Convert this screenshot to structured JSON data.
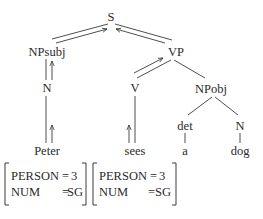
{
  "tree": {
    "nodes": {
      "s": "S",
      "np_subj": "NPsubj",
      "vp": "VP",
      "n_subj": "N",
      "v": "V",
      "np_obj": "NPobj",
      "det": "det",
      "n_obj": "N"
    },
    "leaves": {
      "peter": "Peter",
      "sees": "sees",
      "a": "a",
      "dog": "dog"
    },
    "feature_structures": [
      {
        "for": "Peter",
        "rows": [
          {
            "feature": "PERSON",
            "eq": "=",
            "value": "3"
          },
          {
            "feature": "NUM",
            "eq": "=",
            "value": "SG"
          }
        ]
      },
      {
        "for": "sees",
        "rows": [
          {
            "feature": "PERSON",
            "eq": "=",
            "value": "3"
          },
          {
            "feature": "NUM",
            "eq": "=",
            "value": "SG"
          }
        ]
      }
    ],
    "arrows": [
      {
        "from": "Peter",
        "to": "N",
        "direction": "up"
      },
      {
        "from": "N",
        "to": "NPsubj",
        "direction": "up"
      },
      {
        "from": "NPsubj",
        "to": "S",
        "direction": "up"
      },
      {
        "from": "sees",
        "to": "V",
        "direction": "up"
      },
      {
        "from": "V",
        "to": "VP",
        "direction": "up"
      },
      {
        "from": "VP",
        "to": "S",
        "direction": "up"
      }
    ]
  }
}
